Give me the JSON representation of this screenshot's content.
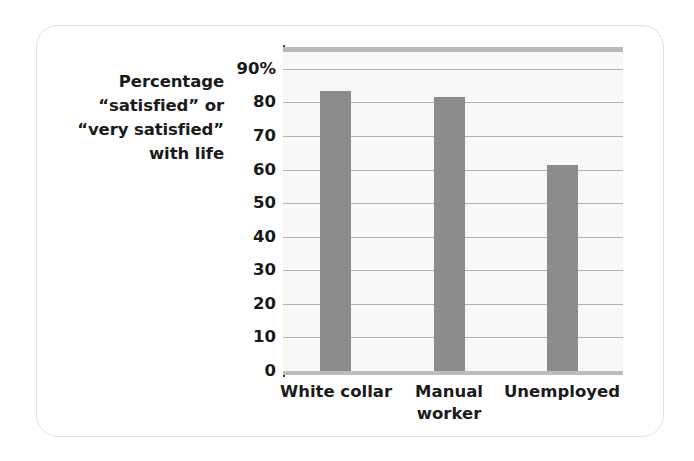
{
  "figure": {
    "card_label": "bar-chart-figure",
    "background_color": "#ffffff",
    "border_color": "#e2e2e2"
  },
  "chart_data": {
    "type": "bar",
    "title": "",
    "subtitle": "",
    "xlabel": "",
    "ylabel_lines": [
      "Percentage",
      "“satisfied” or",
      "“very satisfied”",
      "with life"
    ],
    "ylabel": "Percentage “satisfied” or “very satisfied” with life",
    "categories": [
      "White collar",
      "Manual worker",
      "Unemployed"
    ],
    "category_lines": [
      [
        "White collar"
      ],
      [
        "Manual",
        "worker"
      ],
      [
        "Unemployed"
      ]
    ],
    "values": [
      83.5,
      81.5,
      61.5
    ],
    "ylim": [
      0,
      95
    ],
    "yticks": [
      0,
      10,
      20,
      30,
      40,
      50,
      60,
      70,
      80,
      90
    ],
    "ytick_labels": [
      "0",
      "10",
      "20",
      "30",
      "40",
      "50",
      "60",
      "70",
      "80",
      "90%"
    ],
    "grid": true,
    "grid_orientation": "horizontal",
    "legend": null,
    "legend_position": "none",
    "bar_color": "#8c8c8c",
    "plot_background": "#f8f8f6",
    "gridline_color": "#b2b2b2",
    "axis_color": "#3a3a3a"
  }
}
